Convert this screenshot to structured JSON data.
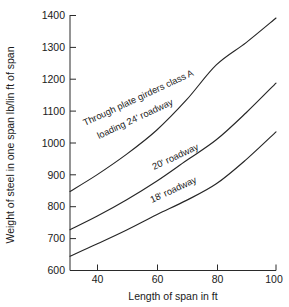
{
  "chart_data": {
    "type": "line",
    "title": "",
    "xlabel": "Length of span in ft",
    "ylabel": "Weight of steel in one span lb/lin ft of span",
    "xlim": [
      31,
      100
    ],
    "ylim": [
      600,
      1400
    ],
    "grid": false,
    "legend_position": "inline-annotations",
    "xticks": [
      40,
      60,
      80,
      100
    ],
    "xtick_labels": [
      "40",
      "60",
      "80",
      "100"
    ],
    "yticks": [
      600,
      700,
      800,
      900,
      1000,
      1100,
      1200,
      1300,
      1400
    ],
    "ytick_labels": [
      "600",
      "700",
      "800",
      "900",
      "1000",
      "1100",
      "1200",
      "1300",
      "1400"
    ],
    "x": [
      31,
      40,
      50,
      60,
      70,
      80,
      90,
      100
    ],
    "series": [
      {
        "name": "Through plate girders class A loading 24' roadway",
        "label_line_1": "Through plate girders class A",
        "label_line_2": "loading 24' roadway",
        "values": [
          848,
          900,
          965,
          1040,
          1135,
          1245,
          1315,
          1392
        ]
      },
      {
        "name": "20' roadway",
        "label_line_1": "20' roadway",
        "label_line_2": "",
        "values": [
          728,
          770,
          822,
          880,
          945,
          1010,
          1095,
          1188
        ]
      },
      {
        "name": "18' roadway",
        "label_line_1": "18' roadway",
        "label_line_2": "",
        "values": [
          645,
          683,
          727,
          775,
          820,
          872,
          948,
          1035
        ]
      }
    ],
    "annotations": [
      {
        "text": "Through plate girders class A",
        "rotation": -25
      },
      {
        "text": "loading 24' roadway",
        "rotation": -25
      },
      {
        "text": "20' roadway",
        "rotation": -25
      },
      {
        "text": "18' roadway",
        "rotation": -25
      }
    ],
    "colors": {
      "curve": "#262626",
      "axis": "#2a2a2a",
      "background": "#ffffff",
      "text": "#1a1a1a"
    }
  }
}
